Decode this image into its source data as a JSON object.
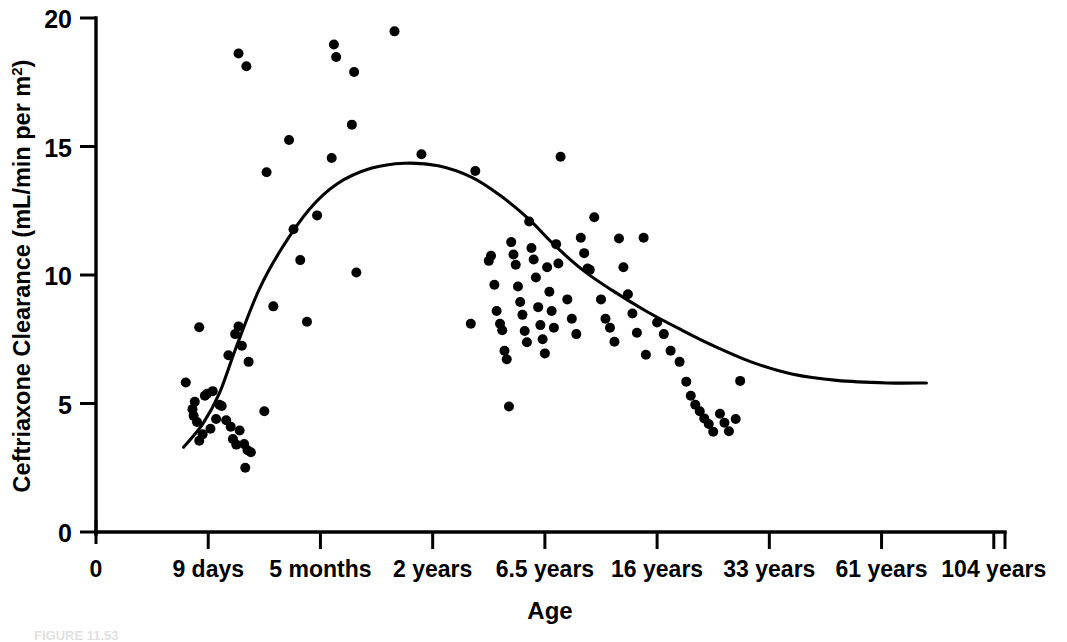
{
  "figure": {
    "background_color": "#ffffff",
    "ink_color": "#000000",
    "caption_prefix": "FIGURE 11.53",
    "caption_visible": false
  },
  "chart_data": {
    "type": "scatter",
    "title": "",
    "subtitle": "",
    "xlabel": "Age",
    "ylabel": "Ceftriaxone Clearance (mL/min per m²)",
    "ylabel_main": "Ceftriaxone Clearance (mL/min per m",
    "ylabel_sup": "2",
    "ylabel_close": ")",
    "grid": false,
    "legend": false,
    "legend_position": "none",
    "ylim": [
      0,
      20
    ],
    "ytick_values": [
      0,
      5,
      10,
      15,
      20
    ],
    "ytick_labels": [
      "0",
      "5",
      "10",
      "15",
      "20"
    ],
    "x_axis_kind": "ordinal-age-scale",
    "xtick_labels": [
      "0",
      "9 days",
      "5 months",
      "2 years",
      "6.5 years",
      "16 years",
      "33 years",
      "61 years",
      "104 years"
    ],
    "xtick_positions": [
      0,
      1,
      2,
      3,
      4,
      5,
      6,
      7,
      8
    ],
    "xlim": [
      0,
      8.1
    ],
    "marker": {
      "shape": "circle",
      "size_px": 10,
      "color": "#000000"
    },
    "series": [
      {
        "name": "Ceftriaxone clearance observations",
        "marker": "filled-circle",
        "points": [
          [
            0.92,
            7.97
          ],
          [
            0.8,
            5.82
          ],
          [
            0.88,
            5.07
          ],
          [
            0.86,
            4.78
          ],
          [
            0.87,
            4.52
          ],
          [
            0.9,
            4.28
          ],
          [
            0.97,
            5.3
          ],
          [
            0.99,
            5.38
          ],
          [
            1.04,
            5.48
          ],
          [
            1.1,
            4.95
          ],
          [
            1.12,
            4.9
          ],
          [
            1.07,
            4.4
          ],
          [
            1.02,
            4.02
          ],
          [
            0.95,
            3.8
          ],
          [
            0.92,
            3.55
          ],
          [
            1.16,
            4.35
          ],
          [
            1.2,
            4.1
          ],
          [
            1.22,
            3.62
          ],
          [
            1.25,
            3.4
          ],
          [
            1.28,
            3.95
          ],
          [
            1.32,
            3.42
          ],
          [
            1.35,
            3.18
          ],
          [
            1.38,
            3.1
          ],
          [
            1.18,
            6.88
          ],
          [
            1.24,
            7.7
          ],
          [
            1.27,
            8.0
          ],
          [
            1.3,
            7.25
          ],
          [
            1.36,
            6.62
          ],
          [
            1.33,
            2.5
          ],
          [
            1.34,
            18.12
          ],
          [
            1.27,
            18.62
          ],
          [
            1.52,
            14.0
          ],
          [
            1.5,
            4.7
          ],
          [
            1.58,
            8.78
          ],
          [
            1.72,
            15.25
          ],
          [
            1.76,
            11.78
          ],
          [
            1.82,
            10.58
          ],
          [
            1.88,
            8.18
          ],
          [
            1.97,
            12.32
          ],
          [
            2.1,
            14.55
          ],
          [
            2.12,
            18.97
          ],
          [
            2.14,
            18.48
          ],
          [
            2.28,
            15.85
          ],
          [
            2.3,
            17.9
          ],
          [
            2.32,
            10.1
          ],
          [
            2.66,
            19.48
          ],
          [
            2.9,
            14.7
          ],
          [
            3.34,
            8.1
          ],
          [
            3.38,
            14.05
          ],
          [
            3.5,
            10.55
          ],
          [
            3.52,
            10.75
          ],
          [
            3.55,
            9.62
          ],
          [
            3.57,
            8.6
          ],
          [
            3.6,
            8.1
          ],
          [
            3.62,
            7.85
          ],
          [
            3.64,
            7.05
          ],
          [
            3.66,
            6.72
          ],
          [
            3.68,
            4.88
          ],
          [
            3.7,
            11.28
          ],
          [
            3.72,
            10.8
          ],
          [
            3.74,
            10.4
          ],
          [
            3.76,
            9.55
          ],
          [
            3.78,
            8.95
          ],
          [
            3.8,
            8.45
          ],
          [
            3.82,
            7.82
          ],
          [
            3.84,
            7.38
          ],
          [
            3.86,
            12.08
          ],
          [
            3.88,
            11.05
          ],
          [
            3.9,
            10.6
          ],
          [
            3.92,
            9.9
          ],
          [
            3.94,
            8.75
          ],
          [
            3.96,
            8.05
          ],
          [
            3.98,
            7.5
          ],
          [
            4.0,
            6.95
          ],
          [
            4.02,
            10.3
          ],
          [
            4.04,
            9.35
          ],
          [
            4.06,
            8.6
          ],
          [
            4.08,
            7.95
          ],
          [
            4.1,
            11.2
          ],
          [
            4.12,
            10.45
          ],
          [
            4.14,
            14.6
          ],
          [
            4.2,
            9.05
          ],
          [
            4.24,
            8.3
          ],
          [
            4.28,
            7.7
          ],
          [
            4.32,
            11.45
          ],
          [
            4.35,
            10.85
          ],
          [
            4.38,
            10.25
          ],
          [
            4.4,
            10.2
          ],
          [
            4.44,
            12.25
          ],
          [
            4.5,
            9.05
          ],
          [
            4.54,
            8.3
          ],
          [
            4.58,
            7.95
          ],
          [
            4.62,
            7.4
          ],
          [
            4.66,
            11.42
          ],
          [
            4.7,
            10.3
          ],
          [
            4.74,
            9.25
          ],
          [
            4.78,
            8.5
          ],
          [
            4.82,
            7.75
          ],
          [
            4.9,
            6.9
          ],
          [
            5.0,
            8.15
          ],
          [
            5.06,
            7.7
          ],
          [
            5.12,
            7.05
          ],
          [
            5.2,
            6.62
          ],
          [
            5.26,
            5.85
          ],
          [
            5.3,
            5.3
          ],
          [
            5.34,
            4.95
          ],
          [
            5.38,
            4.7
          ],
          [
            5.42,
            4.42
          ],
          [
            5.46,
            4.2
          ],
          [
            5.5,
            3.9
          ],
          [
            5.56,
            4.6
          ],
          [
            5.6,
            4.25
          ],
          [
            5.64,
            3.92
          ],
          [
            5.7,
            4.4
          ],
          [
            5.74,
            5.88
          ],
          [
            4.88,
            11.45
          ]
        ]
      }
    ],
    "fit_curve": {
      "name": "smoothed trend line",
      "type": "lowess-spline",
      "points": [
        [
          0.78,
          3.3
        ],
        [
          0.95,
          4.2
        ],
        [
          1.1,
          5.4
        ],
        [
          1.25,
          7.2
        ],
        [
          1.45,
          9.4
        ],
        [
          1.65,
          11.0
        ],
        [
          1.9,
          12.55
        ],
        [
          2.15,
          13.55
        ],
        [
          2.45,
          14.15
        ],
        [
          2.75,
          14.35
        ],
        [
          3.05,
          14.25
        ],
        [
          3.35,
          13.8
        ],
        [
          3.6,
          13.1
        ],
        [
          3.85,
          12.2
        ],
        [
          4.1,
          11.1
        ],
        [
          4.35,
          10.15
        ],
        [
          4.6,
          9.4
        ],
        [
          4.9,
          8.6
        ],
        [
          5.2,
          7.9
        ],
        [
          5.5,
          7.25
        ],
        [
          5.85,
          6.6
        ],
        [
          6.2,
          6.15
        ],
        [
          6.6,
          5.9
        ],
        [
          7.05,
          5.8
        ],
        [
          7.4,
          5.8
        ]
      ]
    }
  }
}
